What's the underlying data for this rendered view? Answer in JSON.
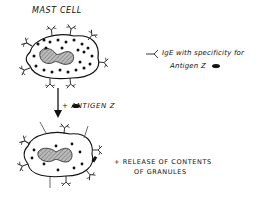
{
  "diagram": {
    "title": "MAST CELL",
    "legend": {
      "line1": "IgE with specificity for",
      "line2": "Antigen Z"
    },
    "step_label": "+ ANTIGEN Z",
    "result_line1": "+ RELEASE OF CONTENTS",
    "result_line2": "OF GRANULES"
  }
}
